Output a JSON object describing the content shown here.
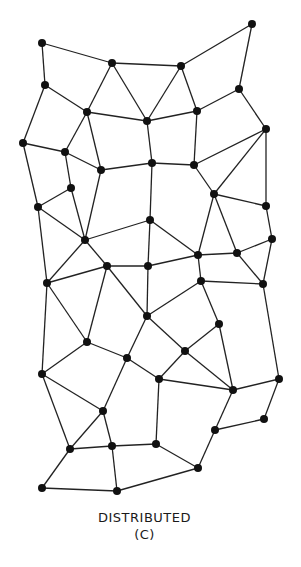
{
  "diagram": {
    "title": "DISTRIBUTED",
    "subtitle": "(C)",
    "colors": {
      "node": "#111111",
      "edge": "#222222",
      "background": "#ffffff"
    },
    "node_radius": 4,
    "nodes": [
      [
        42,
        43
      ],
      [
        112,
        63
      ],
      [
        181,
        66
      ],
      [
        252,
        24
      ],
      [
        45,
        85
      ],
      [
        87,
        112
      ],
      [
        147,
        121
      ],
      [
        197,
        111
      ],
      [
        239,
        89
      ],
      [
        266,
        129
      ],
      [
        23,
        143
      ],
      [
        65,
        152
      ],
      [
        101,
        170
      ],
      [
        152,
        163
      ],
      [
        194,
        165
      ],
      [
        71,
        188
      ],
      [
        214,
        194
      ],
      [
        38,
        207
      ],
      [
        266,
        206
      ],
      [
        150,
        220
      ],
      [
        85,
        240
      ],
      [
        272,
        239
      ],
      [
        198,
        255
      ],
      [
        237,
        253
      ],
      [
        107,
        266
      ],
      [
        148,
        266
      ],
      [
        47,
        283
      ],
      [
        201,
        281
      ],
      [
        263,
        284
      ],
      [
        147,
        316
      ],
      [
        219,
        324
      ],
      [
        87,
        342
      ],
      [
        185,
        351
      ],
      [
        127,
        358
      ],
      [
        42,
        374
      ],
      [
        159,
        379
      ],
      [
        233,
        390
      ],
      [
        279,
        379
      ],
      [
        103,
        411
      ],
      [
        264,
        419
      ],
      [
        215,
        430
      ],
      [
        70,
        449
      ],
      [
        112,
        446
      ],
      [
        156,
        444
      ],
      [
        198,
        468
      ],
      [
        42,
        488
      ],
      [
        117,
        491
      ]
    ],
    "edges": [
      [
        0,
        1
      ],
      [
        0,
        4
      ],
      [
        1,
        2
      ],
      [
        1,
        5
      ],
      [
        1,
        6
      ],
      [
        2,
        3
      ],
      [
        2,
        6
      ],
      [
        2,
        7
      ],
      [
        3,
        8
      ],
      [
        4,
        5
      ],
      [
        4,
        10
      ],
      [
        5,
        6
      ],
      [
        5,
        11
      ],
      [
        5,
        12
      ],
      [
        6,
        7
      ],
      [
        6,
        13
      ],
      [
        7,
        8
      ],
      [
        7,
        14
      ],
      [
        8,
        9
      ],
      [
        9,
        14
      ],
      [
        9,
        16
      ],
      [
        9,
        18
      ],
      [
        10,
        11
      ],
      [
        10,
        17
      ],
      [
        11,
        12
      ],
      [
        11,
        15
      ],
      [
        12,
        13
      ],
      [
        12,
        20
      ],
      [
        13,
        14
      ],
      [
        13,
        19
      ],
      [
        14,
        16
      ],
      [
        15,
        17
      ],
      [
        15,
        20
      ],
      [
        16,
        18
      ],
      [
        16,
        22
      ],
      [
        16,
        23
      ],
      [
        17,
        20
      ],
      [
        17,
        26
      ],
      [
        18,
        21
      ],
      [
        19,
        20
      ],
      [
        19,
        25
      ],
      [
        19,
        22
      ],
      [
        20,
        24
      ],
      [
        20,
        26
      ],
      [
        21,
        23
      ],
      [
        21,
        28
      ],
      [
        22,
        23
      ],
      [
        22,
        25
      ],
      [
        22,
        27
      ],
      [
        23,
        28
      ],
      [
        24,
        25
      ],
      [
        24,
        26
      ],
      [
        24,
        29
      ],
      [
        24,
        31
      ],
      [
        25,
        29
      ],
      [
        26,
        31
      ],
      [
        26,
        34
      ],
      [
        27,
        28
      ],
      [
        27,
        29
      ],
      [
        27,
        30
      ],
      [
        28,
        37
      ],
      [
        29,
        32
      ],
      [
        29,
        33
      ],
      [
        30,
        32
      ],
      [
        30,
        36
      ],
      [
        31,
        33
      ],
      [
        31,
        34
      ],
      [
        32,
        35
      ],
      [
        32,
        36
      ],
      [
        33,
        35
      ],
      [
        33,
        38
      ],
      [
        34,
        38
      ],
      [
        34,
        41
      ],
      [
        35,
        36
      ],
      [
        35,
        43
      ],
      [
        36,
        37
      ],
      [
        36,
        40
      ],
      [
        37,
        39
      ],
      [
        38,
        42
      ],
      [
        38,
        41
      ],
      [
        39,
        40
      ],
      [
        40,
        44
      ],
      [
        41,
        42
      ],
      [
        41,
        45
      ],
      [
        42,
        43
      ],
      [
        42,
        46
      ],
      [
        43,
        44
      ],
      [
        44,
        46
      ],
      [
        45,
        46
      ]
    ]
  }
}
